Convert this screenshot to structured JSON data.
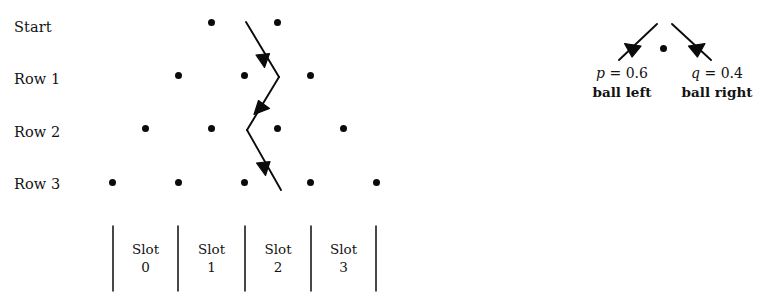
{
  "figure": {
    "type": "galton-board-diagram",
    "background_color": "#ffffff",
    "ink_color": "#0b0b0b"
  },
  "row_labels": [
    {
      "text": "Start",
      "y": 28
    },
    {
      "text": "Row 1",
      "y": 80
    },
    {
      "text": "Row 2",
      "y": 133
    },
    {
      "text": "Row 3",
      "y": 185
    }
  ],
  "pegs": {
    "rows": [
      {
        "name": "Start",
        "y": 22,
        "x": [
          211,
          277
        ]
      },
      {
        "name": "Row 1",
        "y": 75,
        "x": [
          178,
          244,
          310
        ]
      },
      {
        "name": "Row 2",
        "y": 128,
        "x": [
          145,
          211,
          277,
          343
        ]
      },
      {
        "name": "Row 3",
        "y": 182,
        "x": [
          112,
          178,
          244,
          310,
          376
        ]
      }
    ]
  },
  "ball_path": {
    "description": "zigzag path of the ball through the pegs",
    "points": [
      {
        "x": 246,
        "y": 22
      },
      {
        "x": 279,
        "y": 77
      },
      {
        "x": 247,
        "y": 130
      },
      {
        "x": 281,
        "y": 190
      }
    ],
    "arrow_directions": [
      "down-right",
      "down-left",
      "down-right"
    ]
  },
  "slots": {
    "divider_x": [
      113,
      178,
      245,
      311,
      376
    ],
    "divider_top": 226,
    "divider_bottom": 291,
    "items": [
      {
        "word": "Slot",
        "number": "0"
      },
      {
        "word": "Slot",
        "number": "1"
      },
      {
        "word": "Slot",
        "number": "2"
      },
      {
        "word": "Slot",
        "number": "3"
      }
    ]
  },
  "legend": {
    "center_peg": {
      "x": 663,
      "y": 48
    },
    "left": {
      "equation_symbol": "p",
      "equation_rest": " = 0.6",
      "caption": "ball left",
      "arrow": {
        "x1": 657,
        "y1": 24,
        "x2": 619,
        "y2": 60
      }
    },
    "right": {
      "equation_symbol": "q",
      "equation_rest": " = 0.4",
      "caption": "ball right",
      "arrow": {
        "x1": 672,
        "y1": 24,
        "x2": 711,
        "y2": 60
      }
    }
  }
}
